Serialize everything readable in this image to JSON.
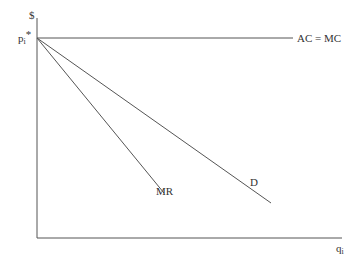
{
  "diagram": {
    "y_axis_label": "$",
    "x_axis_label_base": "q",
    "x_axis_label_sub": "i",
    "price_label_base": "p",
    "price_label_sub": "i",
    "price_label_sup": "*",
    "curves": [
      {
        "name": "AC = MC",
        "type": "horizontal",
        "label": "AC = MC"
      },
      {
        "name": "D",
        "type": "demand",
        "label": "D"
      },
      {
        "name": "MR",
        "type": "marginal-revenue",
        "label": "MR"
      }
    ],
    "line_color": "#555555"
  }
}
